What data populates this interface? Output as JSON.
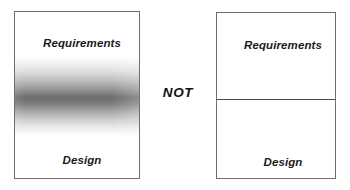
{
  "diagram": {
    "connector": {
      "text": "NOT"
    },
    "colors": {
      "background": "#ffffff",
      "box_border": "#6e6e6e",
      "divider": "#4a4a4a",
      "text": "#1a1a1a",
      "gradient_dark": "#484848"
    },
    "boxes": [
      {
        "id": "gradient-box",
        "kind": "gradient",
        "description": "Single box with a soft blurred gray band between the two regions",
        "top_label": "Requirements",
        "bottom_label": "Design"
      },
      {
        "id": "divided-box",
        "kind": "hard-divider",
        "description": "Single box split by one crisp horizontal line between the two regions",
        "top_label": "Requirements",
        "bottom_label": "Design"
      }
    ]
  }
}
